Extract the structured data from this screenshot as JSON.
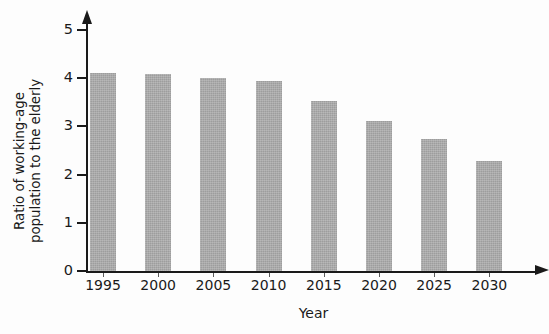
{
  "chart_data": {
    "type": "bar",
    "title": "",
    "xlabel": "Year",
    "ylabel_lines": [
      "Ratio of working-age",
      "population to the elderly"
    ],
    "ylabel": "Ratio of working-age population to the elderly",
    "categories": [
      "1995",
      "2000",
      "2005",
      "2010",
      "2015",
      "2020",
      "2025",
      "2030"
    ],
    "values": [
      4.1,
      4.08,
      4.0,
      3.95,
      3.52,
      3.12,
      2.74,
      2.29
    ],
    "ylim": [
      0,
      5
    ],
    "ytick_labels": [
      "0",
      "1",
      "2",
      "3",
      "4",
      "5"
    ],
    "ytick_values": [
      0,
      1,
      2,
      3,
      4,
      5
    ],
    "grid": false,
    "legend": null,
    "bar_color": "#9d9d9d",
    "axis_color": "#1a1a1a",
    "background": "#fdfdfd",
    "axis_arrows": {
      "x": "arrow-right",
      "y": "arrow-up"
    }
  }
}
